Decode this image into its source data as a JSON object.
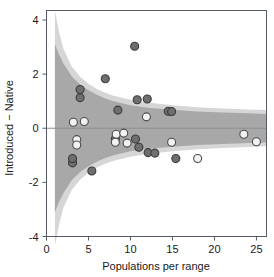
{
  "chart_data": {
    "type": "scatter",
    "title": "",
    "xlabel": "Populations per range",
    "ylabel": "Introduced − Native",
    "xlim": [
      0,
      26.2
    ],
    "ylim": [
      -4,
      4.35
    ],
    "xticks": [
      0,
      5,
      10,
      15,
      20,
      25
    ],
    "xticklabels": [
      "0",
      "5",
      "10",
      "15",
      "20",
      "25"
    ],
    "yticks": [
      -4,
      -2,
      0,
      2,
      4
    ],
    "yticklabels": [
      "-4",
      "-2",
      "0",
      "2",
      "4"
    ],
    "grid": false,
    "legend": null,
    "reference_lines": [
      {
        "orientation": "horizontal",
        "value": 0,
        "color": "#8a8f99"
      }
    ],
    "bands": [
      {
        "name": "outer-prediction-band",
        "color": "#d6d6d6",
        "upper": [
          {
            "x": 1.0,
            "y": 4.35
          },
          {
            "x": 1.5,
            "y": 3.55
          },
          {
            "x": 2.0,
            "y": 2.95
          },
          {
            "x": 3.0,
            "y": 2.28
          },
          {
            "x": 4.0,
            "y": 1.9
          },
          {
            "x": 5.0,
            "y": 1.64
          },
          {
            "x": 6.0,
            "y": 1.45
          },
          {
            "x": 7.0,
            "y": 1.31
          },
          {
            "x": 8.0,
            "y": 1.2
          },
          {
            "x": 10.0,
            "y": 1.05
          },
          {
            "x": 12.0,
            "y": 0.95
          },
          {
            "x": 15.0,
            "y": 0.85
          },
          {
            "x": 18.0,
            "y": 0.78
          },
          {
            "x": 21.0,
            "y": 0.73
          },
          {
            "x": 24.0,
            "y": 0.69
          },
          {
            "x": 26.2,
            "y": 0.67
          }
        ],
        "lower": [
          {
            "x": 1.0,
            "y": -4.35
          },
          {
            "x": 1.5,
            "y": -3.55
          },
          {
            "x": 2.0,
            "y": -2.95
          },
          {
            "x": 3.0,
            "y": -2.28
          },
          {
            "x": 4.0,
            "y": -1.9
          },
          {
            "x": 5.0,
            "y": -1.64
          },
          {
            "x": 6.0,
            "y": -1.45
          },
          {
            "x": 7.0,
            "y": -1.31
          },
          {
            "x": 8.0,
            "y": -1.2
          },
          {
            "x": 10.0,
            "y": -1.05
          },
          {
            "x": 12.0,
            "y": -0.95
          },
          {
            "x": 15.0,
            "y": -0.85
          },
          {
            "x": 18.0,
            "y": -0.78
          },
          {
            "x": 21.0,
            "y": -0.73
          },
          {
            "x": 24.0,
            "y": -0.69
          },
          {
            "x": 26.2,
            "y": -0.67
          }
        ]
      },
      {
        "name": "inner-confidence-band",
        "color": "#a8a8a8",
        "upper": [
          {
            "x": 1.0,
            "y": 3.1
          },
          {
            "x": 1.5,
            "y": 2.72
          },
          {
            "x": 2.0,
            "y": 2.4
          },
          {
            "x": 3.0,
            "y": 1.92
          },
          {
            "x": 4.0,
            "y": 1.62
          },
          {
            "x": 5.0,
            "y": 1.4
          },
          {
            "x": 6.0,
            "y": 1.24
          },
          {
            "x": 7.0,
            "y": 1.1
          },
          {
            "x": 8.0,
            "y": 1.0
          },
          {
            "x": 10.0,
            "y": 0.85
          },
          {
            "x": 12.0,
            "y": 0.76
          },
          {
            "x": 15.0,
            "y": 0.68
          },
          {
            "x": 18.0,
            "y": 0.62
          },
          {
            "x": 21.0,
            "y": 0.58
          },
          {
            "x": 24.0,
            "y": 0.55
          },
          {
            "x": 26.2,
            "y": 0.53
          }
        ],
        "lower": [
          {
            "x": 1.0,
            "y": -3.1
          },
          {
            "x": 1.5,
            "y": -2.72
          },
          {
            "x": 2.0,
            "y": -2.4
          },
          {
            "x": 3.0,
            "y": -1.92
          },
          {
            "x": 4.0,
            "y": -1.62
          },
          {
            "x": 5.0,
            "y": -1.4
          },
          {
            "x": 6.0,
            "y": -1.24
          },
          {
            "x": 7.0,
            "y": -1.1
          },
          {
            "x": 8.0,
            "y": -1.0
          },
          {
            "x": 10.0,
            "y": -0.85
          },
          {
            "x": 12.0,
            "y": -0.76
          },
          {
            "x": 15.0,
            "y": -0.68
          },
          {
            "x": 18.0,
            "y": -0.62
          },
          {
            "x": 21.0,
            "y": -0.58
          },
          {
            "x": 24.0,
            "y": -0.55
          },
          {
            "x": 26.2,
            "y": -0.53
          }
        ]
      }
    ],
    "series": [
      {
        "name": "dark-points",
        "marker": "circle",
        "fill": "#6e6e6e",
        "edge": "#3a3a3a",
        "points": [
          {
            "x": 10.5,
            "y": 3.03
          },
          {
            "x": 7.0,
            "y": 1.83
          },
          {
            "x": 4.0,
            "y": 1.43
          },
          {
            "x": 4.0,
            "y": 1.13
          },
          {
            "x": 10.8,
            "y": 1.05
          },
          {
            "x": 12.0,
            "y": 1.08
          },
          {
            "x": 8.5,
            "y": 0.67
          },
          {
            "x": 14.5,
            "y": 0.63
          },
          {
            "x": 14.9,
            "y": 0.62
          },
          {
            "x": 3.1,
            "y": -1.28
          },
          {
            "x": 3.1,
            "y": -1.12
          },
          {
            "x": 5.4,
            "y": -1.58
          },
          {
            "x": 8.2,
            "y": -0.4
          },
          {
            "x": 10.6,
            "y": -0.4
          },
          {
            "x": 11.0,
            "y": -0.7
          },
          {
            "x": 12.1,
            "y": -0.9
          },
          {
            "x": 12.9,
            "y": -0.92
          },
          {
            "x": 15.4,
            "y": -1.12
          }
        ]
      },
      {
        "name": "light-points",
        "marker": "circle",
        "fill": "#f2f2f2",
        "edge": "#4a4a4a",
        "points": [
          {
            "x": 3.2,
            "y": 0.22
          },
          {
            "x": 4.5,
            "y": 0.25
          },
          {
            "x": 11.9,
            "y": 0.42
          },
          {
            "x": 3.6,
            "y": -0.42
          },
          {
            "x": 3.6,
            "y": -0.62
          },
          {
            "x": 8.3,
            "y": -0.22
          },
          {
            "x": 9.2,
            "y": -0.18
          },
          {
            "x": 8.2,
            "y": -0.52
          },
          {
            "x": 9.6,
            "y": -0.55
          },
          {
            "x": 14.9,
            "y": -0.52
          },
          {
            "x": 18.0,
            "y": -1.12
          },
          {
            "x": 23.5,
            "y": -0.22
          },
          {
            "x": 25.0,
            "y": -0.5
          }
        ]
      }
    ]
  },
  "axes": {
    "xlabel": "Populations per range",
    "ylabel": "Introduced − Native"
  }
}
